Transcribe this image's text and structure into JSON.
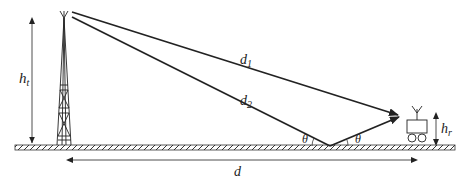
{
  "diagram": {
    "colors": {
      "line": "#222222",
      "ground_fill": "#ffffff",
      "background": "#ffffff"
    },
    "labels": {
      "transmitter_height": "h",
      "transmitter_height_sub": "t",
      "receiver_height": "h",
      "receiver_height_sub": "r",
      "direct_path": "d",
      "direct_path_sub": "1",
      "reflected_path": "d",
      "reflected_path_sub": "2",
      "distance": "d",
      "incidence_angle": "θ",
      "reflection_angle": "θ"
    },
    "elements": {
      "transmitter": "lattice tower with antenna",
      "receiver": "vehicle with antenna",
      "ground": "hatched ground plane"
    }
  }
}
